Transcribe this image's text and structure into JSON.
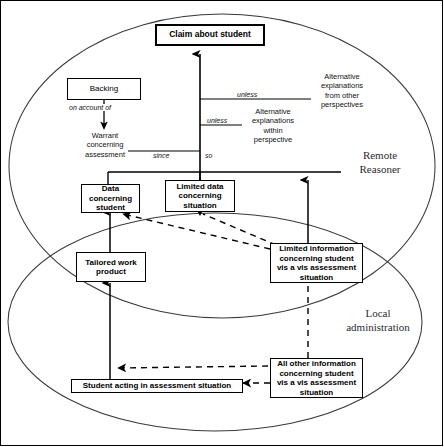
{
  "diagram": {
    "regions": [
      {
        "id": "remote",
        "label": "Remote\nReasoner",
        "label_line1": "Remote",
        "label_line2": "Reasoner"
      },
      {
        "id": "local",
        "label": "Local\nadministration",
        "label_line1": "Local",
        "label_line2": "administration"
      }
    ],
    "nodes": [
      {
        "id": "claim",
        "label": "Claim about student",
        "style": "claim"
      },
      {
        "id": "backing",
        "label": "Backing",
        "style": "plain"
      },
      {
        "id": "data_student",
        "label": "Data concerning student",
        "lines": [
          "Data",
          "concerning",
          "student"
        ],
        "style": "box"
      },
      {
        "id": "limited_data",
        "label": "Limited data concerning situation",
        "lines": [
          "Limited data",
          "concerning",
          "situation"
        ],
        "style": "box"
      },
      {
        "id": "tailored",
        "label": "Tailored work product",
        "lines": [
          "Tailored work",
          "product"
        ],
        "style": "box"
      },
      {
        "id": "limited_info",
        "label": "Limited information concerning student vis a vis assessment situation",
        "lines": [
          "Limited information",
          "concerning student",
          "vis a vis assessment",
          "situation"
        ],
        "style": "box"
      },
      {
        "id": "all_other_info",
        "label": "All other information concerning student vis a vis assessment situation",
        "lines": [
          "All other information",
          "concerning student",
          "vis a vis assessment",
          "situation"
        ],
        "style": "box"
      },
      {
        "id": "student_acting",
        "label": "Student acting in assessment situation",
        "style": "box"
      }
    ],
    "free_texts": [
      {
        "id": "warrant",
        "lines": [
          "Warrant",
          "concerning",
          "assessment"
        ]
      },
      {
        "id": "alt_other",
        "lines": [
          "Alternative",
          "explanations",
          "from other",
          "perspectives"
        ]
      },
      {
        "id": "alt_within",
        "lines": [
          "Alternative",
          "explanations",
          "within",
          "perspective"
        ]
      }
    ],
    "edge_labels": [
      {
        "id": "on_account_of",
        "text": "on account of"
      },
      {
        "id": "unless_outer",
        "text": "unless"
      },
      {
        "id": "unless_inner",
        "text": "unless"
      },
      {
        "id": "since",
        "text": "since"
      },
      {
        "id": "so",
        "text": "so"
      }
    ],
    "colors": {
      "stroke": "#000000",
      "background": "#ffffff",
      "region_label": "#2b2b2b"
    }
  }
}
